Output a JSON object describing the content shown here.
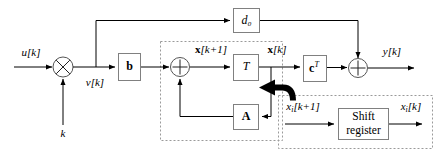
{
  "diagram": {
    "signals": {
      "input": "u[k]",
      "gain_input": "k",
      "after_mult": "v[k]",
      "state_next": "x[k+1]",
      "state_now": "x[k]",
      "output": "y[k]",
      "sr_in": "xᵢ[k+1]",
      "sr_out": "xᵢ[k]"
    },
    "blocks": {
      "feedthrough": "d₀",
      "input_gain": "b",
      "delay": "T",
      "state_matrix": "A",
      "output_gain": "cᵀ",
      "shift_register_line1": "Shift",
      "shift_register_line2": "register"
    },
    "junctions": {
      "multiplier": "⊗",
      "state_sum": "⊕",
      "output_sum": "⊕"
    },
    "groups": {
      "state_block": "state-update-dashed-group",
      "shift_register_block": "shift-register-dashed-group"
    },
    "annotations": {
      "emphasis_arrow": "thick-curved-left-arrow"
    },
    "colors": {
      "line": "#000000",
      "box_border": "#808080",
      "dashed_border": "#9a9a9a",
      "background": "#ffffff"
    }
  }
}
